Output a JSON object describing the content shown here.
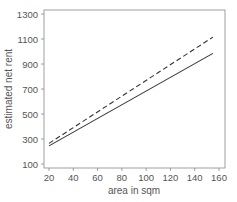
{
  "chart_data": {
    "type": "line",
    "title": "",
    "xlabel": "area in sqm",
    "ylabel": "estimated net rent",
    "xlim": [
      17,
      162
    ],
    "ylim": [
      70,
      1330
    ],
    "xticks": [
      20,
      40,
      60,
      80,
      100,
      120,
      140,
      160
    ],
    "yticks": [
      100,
      300,
      500,
      700,
      900,
      1100,
      1300
    ],
    "grid": false,
    "legend": null,
    "series": [
      {
        "name": "dashed",
        "style": "dashed",
        "x": [
          20,
          155
        ],
        "y": [
          265,
          1115
        ]
      },
      {
        "name": "solid",
        "style": "solid",
        "x": [
          20,
          155
        ],
        "y": [
          245,
          985
        ]
      }
    ]
  }
}
